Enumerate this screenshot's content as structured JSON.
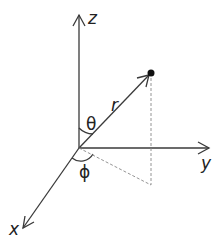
{
  "diagram": {
    "axes": {
      "x": "x",
      "y": "y",
      "z": "z"
    },
    "labels": {
      "radius": "r",
      "polar_angle": "θ",
      "azimuth": "ϕ"
    },
    "colors": {
      "line": "#3a3a3a",
      "dashed": "#888888",
      "point": "#111111"
    }
  }
}
